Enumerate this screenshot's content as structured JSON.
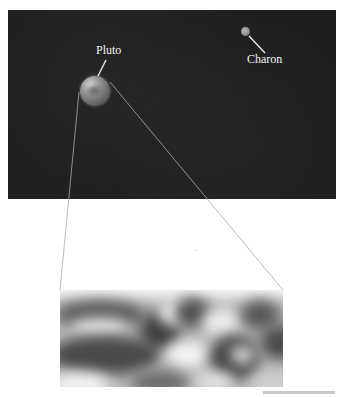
{
  "figure": {
    "panel": {
      "background": "#1f1f1f"
    },
    "bodies": [
      {
        "name": "Pluto",
        "label": "Pluto"
      },
      {
        "name": "Charon",
        "label": "Charon"
      }
    ],
    "inset": {
      "description": "magnified blurry surface view of Pluto",
      "tone": "grayscale"
    },
    "credit": ""
  }
}
